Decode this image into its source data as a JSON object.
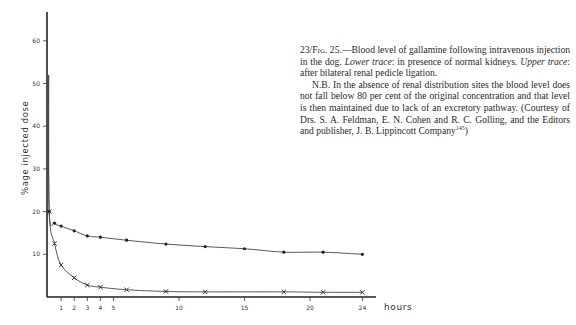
{
  "chart_data": {
    "type": "line",
    "title": "",
    "xlabel": "hours",
    "ylabel": "%age injected dose",
    "xlim": [
      0,
      24
    ],
    "ylim": [
      0,
      65
    ],
    "grid": false,
    "legend": "none (traces described in caption)",
    "x_ticks": [
      1,
      2,
      3,
      4,
      5,
      10,
      15,
      20,
      24
    ],
    "x_tick_labels": [
      "1",
      "2",
      "3",
      "4",
      "5",
      "10",
      "15",
      "20",
      "24"
    ],
    "y_ticks": [
      10,
      20,
      30,
      40,
      50,
      60
    ],
    "y_tick_labels": [
      "10",
      "20",
      "30",
      "40",
      "50",
      "60"
    ],
    "series": [
      {
        "name": "Upper trace (after bilateral renal pedicle ligation)",
        "marker": "dot",
        "x": [
          0.05,
          0.08,
          0.5,
          1,
          2,
          3,
          4,
          6,
          9,
          12,
          15,
          18,
          21,
          24
        ],
        "y": [
          52,
          20,
          17.3,
          16.6,
          15.5,
          14.3,
          14.0,
          13.3,
          12.4,
          11.8,
          11.3,
          10.5,
          10.5,
          10.0
        ]
      },
      {
        "name": "Lower trace (normal kidneys)",
        "marker": "x",
        "x": [
          0.05,
          0.1,
          0.5,
          1,
          2,
          3,
          4,
          6,
          9,
          12,
          18,
          21,
          24
        ],
        "y": [
          52,
          20,
          12.5,
          7.5,
          4.5,
          2.8,
          2.3,
          1.7,
          1.3,
          1.2,
          1.2,
          1.1,
          1.1
        ]
      }
    ]
  },
  "caption": {
    "figure_ref": "23/Fig. 25.",
    "line1": "—Blood level of gallamine following intravenous injection in the dog. ",
    "lower_label": "Lower trace",
    "lower_text": ": in presence of normal kidneys. ",
    "upper_label": "Upper trace",
    "upper_text": ": after bilateral renal pedicle ligation.",
    "nb": "N.B. In the absence of renal distribution sites the blood level does not fall below 80 per cent of the original concentration and that level is then maintained due to lack of an excretory pathway. (Courtesy of Drs. S. A. Feldman, E. N. Cohen and R. C. Golling, and the Editors and publisher, J. B. Lippincott Company",
    "nb_ref": "145",
    "nb_end": ")"
  }
}
